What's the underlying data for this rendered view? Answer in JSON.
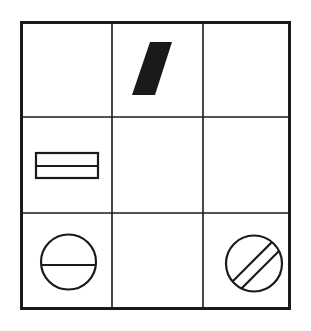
{
  "figure": {
    "type": "matrix-puzzle",
    "background_color": "#ffffff",
    "stroke_color": "#1a1a1a",
    "fill_color": "#1a1a1a",
    "canvas": {
      "width": 311,
      "height": 331
    }
  },
  "grid": {
    "rows": 3,
    "columns": 3,
    "outer_border_width": 3,
    "inner_line_width": 1.6,
    "outer_bounds": {
      "x": 20,
      "y": 21,
      "width": 271,
      "height": 289
    },
    "vertical_dividers": [
      112,
      203
    ],
    "horizontal_dividers": [
      117,
      213
    ]
  },
  "cells": [
    {
      "index": 0,
      "row": 1,
      "column": 1,
      "name": "cell-r1c1",
      "content": "empty",
      "shape": null
    },
    {
      "index": 1,
      "row": 1,
      "column": 2,
      "name": "cell-r1c2",
      "content": "filled-parallelogram",
      "shape": {
        "kind": "parallelogram",
        "fill": "#1a1a1a",
        "stroke": "none",
        "points": "150,42 172,42 155,95 132,95"
      }
    },
    {
      "index": 2,
      "row": 1,
      "column": 3,
      "name": "cell-r1c3",
      "content": "empty",
      "shape": null
    },
    {
      "index": 3,
      "row": 2,
      "column": 1,
      "name": "cell-r2c1",
      "content": "divided-rectangle",
      "shape": {
        "kind": "rectangle-with-horizontal-divider",
        "fill": "none",
        "stroke": "#1a1a1a",
        "stroke_width": 2.2,
        "x": 36,
        "y": 153,
        "width": 62,
        "height": 25,
        "divider_y": 166
      }
    },
    {
      "index": 4,
      "row": 2,
      "column": 2,
      "name": "cell-r2c2",
      "content": "empty",
      "shape": null
    },
    {
      "index": 5,
      "row": 2,
      "column": 3,
      "name": "cell-r2c3",
      "content": "empty",
      "shape": null
    },
    {
      "index": 6,
      "row": 3,
      "column": 1,
      "name": "cell-r3c1",
      "content": "circle-with-horizontal-diameter",
      "shape": {
        "kind": "circle-with-horizontal-line",
        "fill": "none",
        "stroke": "#1a1a1a",
        "stroke_width": 2.2,
        "cx": 68.5,
        "cy": 262,
        "r": 27.5,
        "line_y": 265
      }
    },
    {
      "index": 7,
      "row": 3,
      "column": 2,
      "name": "cell-r3c2",
      "content": "empty",
      "shape": null
    },
    {
      "index": 8,
      "row": 3,
      "column": 3,
      "name": "cell-r3c3",
      "content": "circle-with-diagonal-band",
      "shape": {
        "kind": "circle-with-diagonal-band",
        "fill": "none",
        "stroke": "#1a1a1a",
        "stroke_width": 2.2,
        "cx": 254,
        "cy": 263.5,
        "r": 28,
        "band_line_1": "234.5,283.5 271.5,246.5",
        "band_line_2": "241.5,288.5 277.5,252.5"
      }
    }
  ]
}
